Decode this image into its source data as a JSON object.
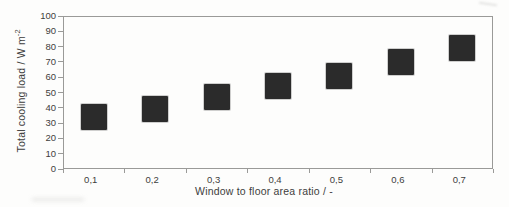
{
  "chart_data": {
    "type": "scatter",
    "marker_shape": "square",
    "title": "",
    "xlabel": "Window to floor area ratio / -",
    "ylabel": "Total cooling load / W m⁻²",
    "ylabel_main": "Total cooling load / W m",
    "ylabel_sup": "-2",
    "categories": [
      "0,1",
      "0,2",
      "0,3",
      "0,4",
      "0,5",
      "0,6",
      "0,7"
    ],
    "x": [
      0.1,
      0.2,
      0.3,
      0.4,
      0.5,
      0.6,
      0.7
    ],
    "values": [
      34,
      39,
      47,
      54,
      61,
      70,
      79
    ],
    "ylim": [
      0,
      100
    ],
    "ytick_step": 10,
    "yticks": [
      0,
      10,
      20,
      30,
      40,
      50,
      60,
      70,
      80,
      90,
      100
    ],
    "grid": false,
    "legend": null,
    "marker_color": "#2b2b2b",
    "axis_color": "#9a9a98",
    "text_color": "#3d3d3d",
    "marker_size_px": 26
  }
}
